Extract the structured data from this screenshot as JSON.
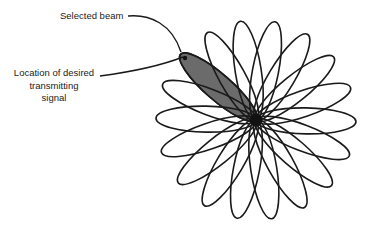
{
  "figure": {
    "labels": {
      "selected_beam": "Selected beam",
      "desired_signal_lines": [
        "Location of desired",
        "transmitting",
        "signal"
      ]
    },
    "pattern": {
      "center": [
        256,
        120
      ],
      "petal_count": 18,
      "petal_spacing_deg": 20,
      "selected_beam_angle_deg": 139,
      "petal_length_px": 100,
      "petal_width_px": 26
    },
    "colors": {
      "background": "#ffffff",
      "outline": "#1a1a1a",
      "selected_fill": "#6b6b6b",
      "label_text": "#222222"
    },
    "icons": {
      "target_dot": "filled-circle",
      "leader_line": "curved-arrow-line"
    }
  }
}
